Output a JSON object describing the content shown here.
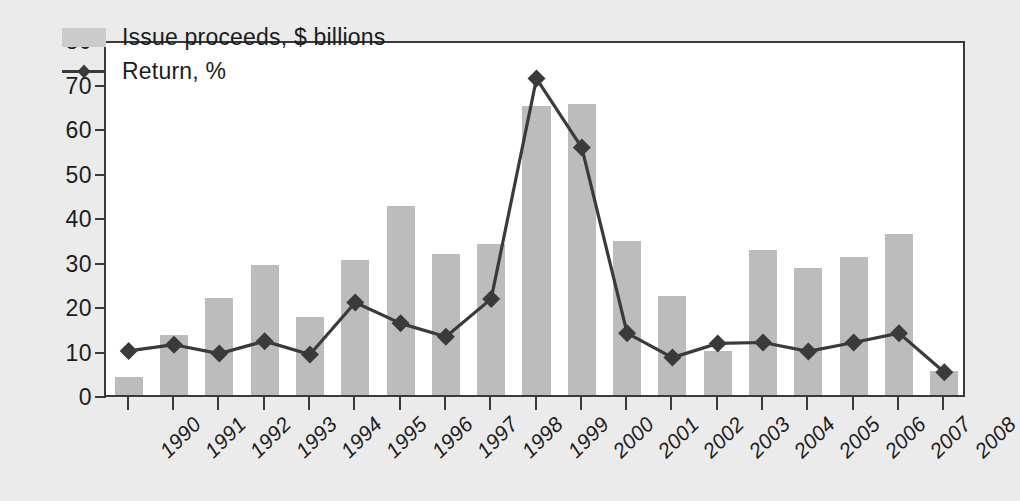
{
  "chart_data": {
    "type": "bar",
    "title": "",
    "xlabel": "",
    "ylabel": "",
    "ylim": [
      0,
      80
    ],
    "ytick_values": [
      0,
      10,
      20,
      30,
      40,
      50,
      60,
      70,
      80
    ],
    "ytick_labels": [
      "0",
      "10",
      "20",
      "30",
      "40",
      "50",
      "60",
      "70",
      "80"
    ],
    "grid": false,
    "legend_position": "upper-left-inside",
    "categories": [
      "1990",
      "1991",
      "1992",
      "1993",
      "1994",
      "1995",
      "1996",
      "1997",
      "1998",
      "1999",
      "2000",
      "2001",
      "2002",
      "2003",
      "2004",
      "2005",
      "2006",
      "2007",
      "2008"
    ],
    "series": [
      {
        "name": "Issue proceeds, $ billions",
        "type": "bar",
        "color": "#bcbcbc",
        "values": [
          4.0,
          13.5,
          21.8,
          29.3,
          17.5,
          30.3,
          42.5,
          31.7,
          34.0,
          65.0,
          65.3,
          34.5,
          22.2,
          10.0,
          32.5,
          28.6,
          31.0,
          36.2,
          5.5
        ]
      },
      {
        "name": "Return, %",
        "type": "line",
        "color": "#3a3a3a",
        "marker": "diamond",
        "values": [
          10.8,
          12.2,
          10.2,
          13.0,
          10.0,
          21.7,
          17.0,
          14.0,
          22.5,
          72.0,
          56.5,
          14.8,
          9.3,
          12.5,
          12.7,
          10.7,
          12.7,
          14.8,
          6.0
        ]
      }
    ]
  },
  "legend": {
    "items": [
      {
        "label": "Issue proceeds, $ billions",
        "marker": "swatch"
      },
      {
        "label": "Return, %",
        "marker": "line-diamond"
      }
    ]
  },
  "colors": {
    "background": "#ebebeb",
    "plot_background": "#ffffff",
    "bar_fill": "#bcbcbc",
    "line": "#3a3a3a",
    "axis": "#3a3a3a",
    "text": "#1c1c1c"
  }
}
